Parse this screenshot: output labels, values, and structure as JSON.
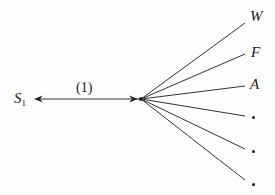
{
  "diagram": {
    "source_node": {
      "label": "S",
      "subscript": "1"
    },
    "edge_label": "(1)",
    "branches": [
      {
        "label": "W",
        "kind": "text"
      },
      {
        "label": "F",
        "kind": "text"
      },
      {
        "label": "A",
        "kind": "text"
      },
      {
        "label": "·",
        "kind": "dot"
      },
      {
        "label": "·",
        "kind": "dot"
      },
      {
        "label": "·",
        "kind": "dot"
      }
    ],
    "line_color": "#333333"
  }
}
